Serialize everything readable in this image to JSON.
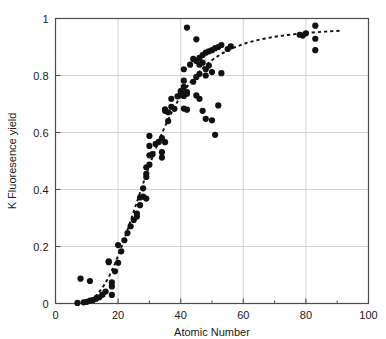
{
  "chart_data": {
    "type": "scatter",
    "title": "",
    "xlabel": "Atomic Number",
    "ylabel": "K Fluoresence yield",
    "xlim": [
      0,
      100
    ],
    "ylim": [
      0,
      1
    ],
    "xticks": [
      0,
      20,
      40,
      60,
      80,
      100
    ],
    "yticks": [
      0,
      0.2,
      0.4,
      0.6,
      0.8,
      1
    ],
    "xtick_labels": [
      "0",
      "20",
      "40",
      "60",
      "80",
      "100"
    ],
    "ytick_labels": [
      "0",
      "0.2",
      "0.4",
      "0.6",
      "0.8",
      "1"
    ],
    "grid": true,
    "grid_color": "#c8c8c8",
    "legend": "none",
    "marker": {
      "shape": "circle",
      "color": "#111111",
      "size": 3.1
    },
    "series": [
      {
        "name": "K fluorescence yield measurements",
        "kind": "points",
        "points": [
          [
            7,
            0.002
          ],
          [
            8,
            0.087
          ],
          [
            9,
            0.004
          ],
          [
            10,
            0.006
          ],
          [
            11,
            0.01
          ],
          [
            11,
            0.079
          ],
          [
            12,
            0.012
          ],
          [
            13,
            0.017
          ],
          [
            14,
            0.022
          ],
          [
            15,
            0.031
          ],
          [
            16,
            0.042
          ],
          [
            17,
            0.145
          ],
          [
            17,
            0.148
          ],
          [
            18,
            0.03
          ],
          [
            18,
            0.06
          ],
          [
            18,
            0.074
          ],
          [
            19,
            0.113
          ],
          [
            20,
            0.205
          ],
          [
            20,
            0.143
          ],
          [
            21,
            0.183
          ],
          [
            22,
            0.222
          ],
          [
            23,
            0.247
          ],
          [
            24,
            0.271
          ],
          [
            25,
            0.293
          ],
          [
            26,
            0.305
          ],
          [
            26,
            0.315
          ],
          [
            27,
            0.345
          ],
          [
            27,
            0.372
          ],
          [
            28,
            0.375
          ],
          [
            28,
            0.404
          ],
          [
            29,
            0.368
          ],
          [
            29,
            0.444
          ],
          [
            29,
            0.455
          ],
          [
            29,
            0.478
          ],
          [
            30,
            0.487
          ],
          [
            30,
            0.52
          ],
          [
            30,
            0.553
          ],
          [
            30,
            0.588
          ],
          [
            31,
            0.524
          ],
          [
            32,
            0.56
          ],
          [
            33,
            0.567
          ],
          [
            34,
            0.58
          ],
          [
            34,
            0.531
          ],
          [
            34,
            0.512
          ],
          [
            35,
            0.566
          ],
          [
            35,
            0.676
          ],
          [
            35,
            0.681
          ],
          [
            36,
            0.671
          ],
          [
            36,
            0.64
          ],
          [
            37,
            0.69
          ],
          [
            37,
            0.718
          ],
          [
            38,
            0.683
          ],
          [
            39,
            0.727
          ],
          [
            40,
            0.733
          ],
          [
            40,
            0.745
          ],
          [
            41,
            0.76
          ],
          [
            41,
            0.782
          ],
          [
            41,
            0.728
          ],
          [
            41,
            0.822
          ],
          [
            41,
            0.684
          ],
          [
            42,
            0.968
          ],
          [
            42,
            0.742
          ],
          [
            42,
            0.736
          ],
          [
            42,
            0.68
          ],
          [
            43,
            0.838
          ],
          [
            44,
            0.778
          ],
          [
            44,
            0.858
          ],
          [
            45,
            0.851
          ],
          [
            45,
            0.795
          ],
          [
            45,
            0.927
          ],
          [
            45,
            0.73
          ],
          [
            46,
            0.862
          ],
          [
            46,
            0.838
          ],
          [
            46,
            0.806
          ],
          [
            46,
            0.718
          ],
          [
            47,
            0.872
          ],
          [
            47,
            0.845
          ],
          [
            47,
            0.676
          ],
          [
            48,
            0.88
          ],
          [
            48,
            0.822
          ],
          [
            48,
            0.8
          ],
          [
            48,
            0.648
          ],
          [
            49,
            0.885
          ],
          [
            49,
            0.835
          ],
          [
            50,
            0.889
          ],
          [
            50,
            0.812
          ],
          [
            50,
            0.643
          ],
          [
            51,
            0.896
          ],
          [
            51,
            0.592
          ],
          [
            52,
            0.9
          ],
          [
            52,
            0.695
          ],
          [
            53,
            0.907
          ],
          [
            53,
            0.808
          ],
          [
            55,
            0.893
          ],
          [
            56,
            0.902
          ],
          [
            78,
            0.943
          ],
          [
            79,
            0.94
          ],
          [
            80,
            0.948
          ],
          [
            83,
            0.975
          ],
          [
            83,
            0.929
          ],
          [
            83,
            0.889
          ]
        ]
      },
      {
        "name": "fitted trend",
        "kind": "dashed-line",
        "points": [
          [
            9,
            0.006
          ],
          [
            11,
            0.012
          ],
          [
            13,
            0.028
          ],
          [
            15,
            0.055
          ],
          [
            17,
            0.092
          ],
          [
            19,
            0.14
          ],
          [
            21,
            0.196
          ],
          [
            23,
            0.258
          ],
          [
            25,
            0.323
          ],
          [
            27,
            0.389
          ],
          [
            29,
            0.453
          ],
          [
            31,
            0.514
          ],
          [
            33,
            0.571
          ],
          [
            35,
            0.622
          ],
          [
            37,
            0.668
          ],
          [
            39,
            0.709
          ],
          [
            41,
            0.744
          ],
          [
            43,
            0.775
          ],
          [
            45,
            0.802
          ],
          [
            47,
            0.825
          ],
          [
            49,
            0.845
          ],
          [
            51,
            0.862
          ],
          [
            53,
            0.876
          ],
          [
            55,
            0.888
          ],
          [
            58,
            0.902
          ],
          [
            61,
            0.914
          ],
          [
            64,
            0.923
          ],
          [
            67,
            0.93
          ],
          [
            70,
            0.936
          ],
          [
            74,
            0.942
          ],
          [
            78,
            0.947
          ],
          [
            82,
            0.951
          ],
          [
            86,
            0.954
          ],
          [
            91,
            0.957
          ]
        ]
      }
    ]
  },
  "axes": {
    "x_title": "Atomic Number",
    "y_title": "K Fluoresence yield"
  }
}
